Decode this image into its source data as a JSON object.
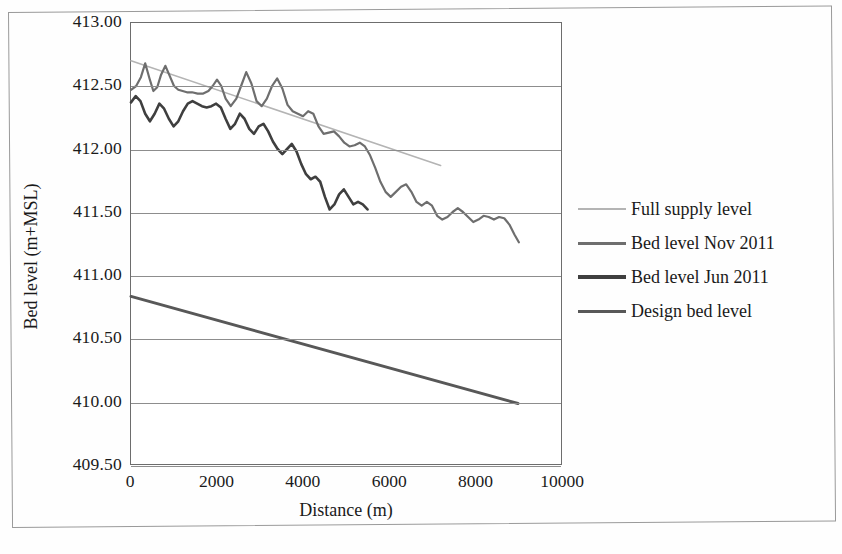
{
  "chart_data": {
    "type": "line",
    "title": "",
    "xlabel": "Distance (m)",
    "ylabel": "Bed level (m+MSL)",
    "xlim": [
      0,
      10000
    ],
    "ylim": [
      409.5,
      413.0
    ],
    "xticks": [
      "0",
      "2000",
      "4000",
      "6000",
      "8000",
      "10000"
    ],
    "xtick_values": [
      0,
      2000,
      4000,
      6000,
      8000,
      10000
    ],
    "yticks": [
      "413.00",
      "412.50",
      "412.00",
      "411.50",
      "411.00",
      "410.50",
      "410.00",
      "409.50"
    ],
    "ytick_values": [
      413.0,
      412.5,
      412.0,
      411.5,
      411.0,
      410.5,
      410.0,
      409.5
    ],
    "grid": true,
    "grid_axis": "y",
    "legend_position": "right",
    "series": [
      {
        "name": "Full supply level",
        "color": "#b4b4b4",
        "width": 1.6,
        "x": [
          0,
          7200
        ],
        "values": [
          412.7,
          411.87
        ]
      },
      {
        "name": "Bed level Nov 2011",
        "color": "#6e6e6e",
        "width": 2.2,
        "x": [
          0,
          120,
          230,
          330,
          430,
          520,
          610,
          700,
          800,
          900,
          1000,
          1100,
          1200,
          1300,
          1420,
          1550,
          1680,
          1800,
          1900,
          2000,
          2100,
          2200,
          2320,
          2450,
          2560,
          2680,
          2800,
          2920,
          3040,
          3160,
          3280,
          3400,
          3520,
          3640,
          3760,
          3880,
          4000,
          4120,
          4240,
          4360,
          4480,
          4600,
          4720,
          4840,
          4960,
          5080,
          5200,
          5320,
          5440,
          5560,
          5680,
          5800,
          5920,
          6040,
          6160,
          6280,
          6400,
          6520,
          6640,
          6760,
          6880,
          7000,
          7120,
          7240,
          7360,
          7480,
          7600,
          7720,
          7840,
          7960,
          8080,
          8200,
          8320,
          8440,
          8560,
          8680,
          8800,
          8920,
          9020
        ],
        "values": [
          412.47,
          412.5,
          412.57,
          412.68,
          412.56,
          412.46,
          412.49,
          412.59,
          412.66,
          412.58,
          412.5,
          412.47,
          412.46,
          412.45,
          412.45,
          412.44,
          412.44,
          412.46,
          412.5,
          412.55,
          412.5,
          412.4,
          412.34,
          412.4,
          412.5,
          412.61,
          412.52,
          412.38,
          412.34,
          412.4,
          412.5,
          412.56,
          412.48,
          412.35,
          412.3,
          412.28,
          412.26,
          412.3,
          412.28,
          412.18,
          412.12,
          412.13,
          412.14,
          412.1,
          412.05,
          412.02,
          412.03,
          412.05,
          412.02,
          411.95,
          411.85,
          411.74,
          411.66,
          411.62,
          411.66,
          411.7,
          411.72,
          411.66,
          411.58,
          411.55,
          411.58,
          411.55,
          411.47,
          411.44,
          411.46,
          411.5,
          411.53,
          411.5,
          411.46,
          411.42,
          411.44,
          411.47,
          411.46,
          411.44,
          411.46,
          411.45,
          411.4,
          411.32,
          411.26
        ]
      },
      {
        "name": "Bed level Jun 2011",
        "color": "#3f3f3f",
        "width": 2.6,
        "x": [
          0,
          110,
          220,
          330,
          440,
          550,
          660,
          770,
          880,
          990,
          1100,
          1210,
          1320,
          1430,
          1540,
          1650,
          1760,
          1870,
          1980,
          2090,
          2200,
          2310,
          2420,
          2530,
          2640,
          2750,
          2860,
          2970,
          3080,
          3190,
          3300,
          3410,
          3520,
          3630,
          3740,
          3850,
          3960,
          4070,
          4180,
          4290,
          4400,
          4510,
          4620,
          4730,
          4840,
          4950,
          5060,
          5170,
          5280,
          5390,
          5500
        ],
        "values": [
          412.37,
          412.42,
          412.38,
          412.28,
          412.22,
          412.28,
          412.36,
          412.32,
          412.24,
          412.18,
          412.22,
          412.3,
          412.36,
          412.38,
          412.36,
          412.34,
          412.33,
          412.34,
          412.36,
          412.33,
          412.24,
          412.16,
          412.2,
          412.28,
          412.24,
          412.16,
          412.12,
          412.18,
          412.2,
          412.14,
          412.06,
          412.0,
          411.96,
          412.0,
          412.04,
          411.98,
          411.88,
          411.8,
          411.76,
          411.78,
          411.74,
          411.62,
          411.52,
          411.56,
          411.64,
          411.68,
          411.62,
          411.56,
          411.58,
          411.56,
          411.52
        ]
      },
      {
        "name": "Design bed level",
        "color": "#585858",
        "width": 3.0,
        "x": [
          0,
          9000
        ],
        "values": [
          410.83,
          409.98
        ]
      }
    ]
  },
  "legend": {
    "items": [
      {
        "label": "Full supply level",
        "color": "#b4b4b4",
        "thickness": 2
      },
      {
        "label": "Bed level Nov 2011",
        "color": "#6e6e6e",
        "thickness": 3
      },
      {
        "label": "Bed level Jun 2011",
        "color": "#3f3f3f",
        "thickness": 4
      },
      {
        "label": "Design bed level",
        "color": "#585858",
        "thickness": 3
      }
    ]
  }
}
